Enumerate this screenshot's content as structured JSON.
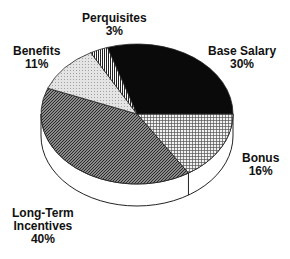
{
  "chart_data": {
    "type": "pie",
    "style": "3d-tilted",
    "title": "",
    "slices": [
      {
        "label": "Base Salary",
        "value": 30,
        "value_label": "30%",
        "fill": "black"
      },
      {
        "label": "Bonus",
        "value": 16,
        "value_label": "16%",
        "fill": "crosshatch"
      },
      {
        "label": "Long-Term Incentives",
        "value": 40,
        "value_label": "40%",
        "fill": "dark-diagonal-hatch"
      },
      {
        "label": "Benefits",
        "value": 11,
        "value_label": "11%",
        "fill": "light-dots"
      },
      {
        "label": "Perquisites",
        "value": 3,
        "value_label": "3%",
        "fill": "vertical-stripes"
      }
    ],
    "legend": "none"
  },
  "labels": {
    "base_salary": {
      "name": "Base Salary",
      "pct": "30%"
    },
    "bonus": {
      "name": "Bonus",
      "pct": "16%"
    },
    "lti_line1": "Long-Term",
    "lti_line2": "Incentives",
    "lti_pct": "40%",
    "benefits": {
      "name": "Benefits",
      "pct": "11%"
    },
    "perquisites": {
      "name": "Perquisites",
      "pct": "3%"
    }
  }
}
